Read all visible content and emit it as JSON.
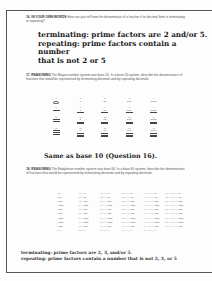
{
  "q16": {
    "number": "16.",
    "label": "IN YOUR OWN WORDS",
    "prompt": "How can you tell from the denominator of a fraction if its decimal form is terminating or repeating?",
    "answer_lines": [
      "terminating: prime factors are 2 and/or 5.",
      "repeating: prime factors contain a number",
      "that is not 2 or 5"
    ]
  },
  "q17": {
    "number": "17.",
    "label": "REASONING",
    "prompt": "The Mayan number system was base 20. In a base 20 system, describe the denominators of fractions that would be represented by terminating decimals and by repeating decimals.",
    "mayan_numerals": [
      {
        "value": "0",
        "dots": 0,
        "bars": 0,
        "shell": true
      },
      {
        "value": "1",
        "dots": 1,
        "bars": 0
      },
      {
        "value": "2",
        "dots": 2,
        "bars": 0
      },
      {
        "value": "3",
        "dots": 3,
        "bars": 0
      },
      {
        "value": "4",
        "dots": 4,
        "bars": 0
      },
      {
        "value": "5",
        "dots": 0,
        "bars": 1
      },
      {
        "value": "6",
        "dots": 1,
        "bars": 1
      },
      {
        "value": "7",
        "dots": 2,
        "bars": 1
      },
      {
        "value": "8",
        "dots": 3,
        "bars": 1
      },
      {
        "value": "9",
        "dots": 4,
        "bars": 1
      },
      {
        "value": "10",
        "dots": 0,
        "bars": 2
      },
      {
        "value": "11",
        "dots": 1,
        "bars": 2
      },
      {
        "value": "12",
        "dots": 2,
        "bars": 2
      },
      {
        "value": "13",
        "dots": 3,
        "bars": 2
      },
      {
        "value": "14",
        "dots": 4,
        "bars": 2
      },
      {
        "value": "15",
        "dots": 0,
        "bars": 3
      },
      {
        "value": "16",
        "dots": 1,
        "bars": 3
      },
      {
        "value": "17",
        "dots": 2,
        "bars": 3
      },
      {
        "value": "18",
        "dots": 3,
        "bars": 3
      },
      {
        "value": "19",
        "dots": 4,
        "bars": 3
      }
    ],
    "answer": "Same as base 10 (Question 16)."
  },
  "q18": {
    "number": "18.",
    "label": "REASONING",
    "prompt": "The Babylonian number system was base 60. In a base 60 system, describe the denominators of fractions that would be represented by terminating decimals and by repeating decimals.",
    "babylonian_rows": [
      [
        "1 ᐁ",
        "11 ◁ᐁ",
        "21 ◁◁ᐁ",
        "31 ◁◁◁ᐁ",
        "41 ◁◁◁◁ᐁ",
        "51 ◁◁◁◁◁ᐁ"
      ],
      [
        "2 ᐁᐁ",
        "12 ◁ᐁᐁ",
        "22 ◁◁ᐁᐁ",
        "32 ◁◁◁ᐁᐁ",
        "42 ◁◁◁◁ᐁᐁ",
        "52 ◁◁◁◁◁ᐁᐁ"
      ],
      [
        "3 ᐁᐁᐁ",
        "13 ◁ᐁᐁᐁ",
        "23 ◁◁ᐁᐁᐁ",
        "33 ◁◁◁ᐁᐁᐁ",
        "43 ◁◁◁◁ᐁᐁᐁ",
        "53 ◁◁◁◁◁ᐁᐁᐁ"
      ],
      [
        "4 ᐁᐁᐁᐁ",
        "14 ◁ᐁᐁᐁᐁ",
        "24 ◁◁ᐁᐁᐁᐁ",
        "34 ◁◁◁ᐁᐁᐁᐁ",
        "44 ◁◁◁◁ᐁᐁᐁᐁ",
        "54 ◁◁◁◁◁ᐁᐁᐁᐁ"
      ],
      [
        "5 ᐁᐁᐁ",
        "15 ◁ᐁᐁᐁ",
        "25 ◁◁ᐁᐁᐁ",
        "35 ◁◁◁ᐁᐁᐁ",
        "45 ◁◁◁◁ᐁᐁᐁ",
        "55 ◁◁◁◁◁ᐁᐁᐁ"
      ],
      [
        "6 ᐁᐁᐁ",
        "16 ◁ᐁᐁᐁ",
        "26 ◁◁ᐁᐁᐁ",
        "36 ◁◁◁ᐁᐁᐁ",
        "46 ◁◁◁◁ᐁᐁᐁ",
        "56 ◁◁◁◁◁ᐁᐁᐁ"
      ],
      [
        "7 ᐁᐁᐁᐁ",
        "17 ◁ᐁᐁᐁᐁ",
        "27 ◁◁ᐁᐁᐁᐁ",
        "37 ◁◁◁ᐁᐁᐁᐁ",
        "47 ◁◁◁◁ᐁᐁᐁᐁ",
        "57 ◁◁◁◁◁ᐁᐁᐁᐁ"
      ],
      [
        "8 ᐁᐁᐁᐁ",
        "18 ◁ᐁᐁᐁᐁ",
        "28 ◁◁ᐁᐁᐁᐁ",
        "38 ◁◁◁ᐁᐁᐁᐁ",
        "48 ◁◁◁◁ᐁᐁᐁᐁ",
        "58 ◁◁◁◁◁ᐁᐁᐁᐁ"
      ],
      [
        "9 ᐁᐁᐁ",
        "19 ◁ᐁᐁᐁ",
        "29 ◁◁ᐁᐁᐁ",
        "39 ◁◁◁ᐁᐁᐁ",
        "49 ◁◁◁◁ᐁᐁᐁ",
        "59 ◁◁◁◁◁ᐁᐁᐁ"
      ],
      [
        "10 ◁",
        "20 ◁◁",
        "30 ◁◁◁",
        "40 ◁◁◁◁",
        "50 ◁◁◁◁◁",
        ""
      ]
    ],
    "answer_lines": [
      "terminating: prime factors are 2, 3, and/or 5.",
      "repeating: prime factors contain a number that is not 2, 3, or 5"
    ]
  }
}
